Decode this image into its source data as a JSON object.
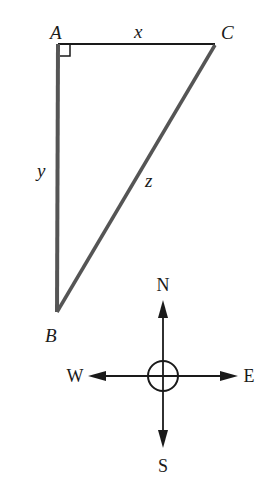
{
  "figure": {
    "type": "right-triangle-with-compass",
    "colors": {
      "background": "#ffffff",
      "stroke": "#1a1a1a",
      "side_stroke": "#555555"
    },
    "triangle": {
      "vertices": {
        "A": {
          "label": "A",
          "x": 58,
          "y": 44
        },
        "B": {
          "label": "B",
          "x": 57,
          "y": 312
        },
        "C": {
          "label": "C",
          "x": 215,
          "y": 44
        }
      },
      "right_angle_at": "A",
      "sides": {
        "AC": {
          "label": "x"
        },
        "AB": {
          "label": "y"
        },
        "BC": {
          "label": "z"
        }
      }
    },
    "compass": {
      "center": {
        "x": 163,
        "y": 376
      },
      "labels": {
        "north": "N",
        "south": "S",
        "east": "E",
        "west": "W"
      }
    }
  }
}
